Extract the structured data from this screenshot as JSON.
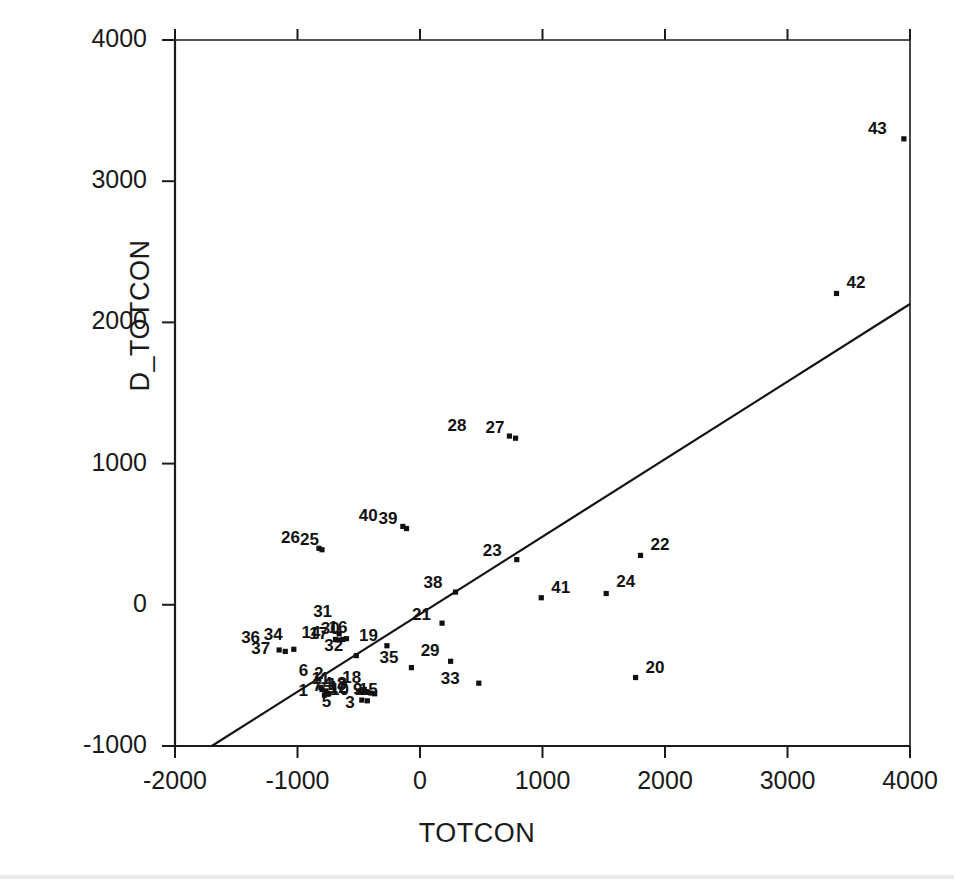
{
  "chart_data": {
    "type": "scatter",
    "title": "",
    "xlabel": "TOTCON",
    "ylabel": "D_TOTCON",
    "xlim": [
      -2000,
      4000
    ],
    "ylim": [
      -1000,
      4000
    ],
    "xticks": [
      "-2000",
      "-1000",
      "0",
      "1000",
      "2000",
      "3000",
      "4000"
    ],
    "xtick_values": [
      -2000,
      -1000,
      0,
      1000,
      2000,
      3000,
      4000
    ],
    "yticks": [
      "-1000",
      "0",
      "1000",
      "2000",
      "3000",
      "4000"
    ],
    "ytick_values": [
      -1000,
      0,
      1000,
      2000,
      3000,
      4000
    ],
    "grid": false,
    "legend": "none",
    "marker": "small-filled-square",
    "point_color": "#111111",
    "line_color": "#111111",
    "axis_color": "#1a1a1a",
    "regression_line": {
      "label": "fit-line",
      "x_start": -1700,
      "y_start": -1000,
      "x_end": 4000,
      "y_end": 2130,
      "slope": 0.549,
      "intercept": -66
    },
    "points": [
      {
        "label": "1",
        "x": -780,
        "y": -640,
        "label_dx": -26,
        "label_dy": -4
      },
      {
        "label": "2",
        "x": -800,
        "y": -600,
        "label_dx": -8,
        "label_dy": -16
      },
      {
        "label": "3",
        "x": -430,
        "y": -680,
        "label_dx": -22,
        "label_dy": 2
      },
      {
        "label": "4",
        "x": -760,
        "y": -625,
        "label_dx": -4,
        "label_dy": -9
      },
      {
        "label": "5",
        "x": -475,
        "y": -675,
        "label_dx": -40,
        "label_dy": 2
      },
      {
        "label": "6",
        "x": -810,
        "y": -585,
        "label_dx": -22,
        "label_dy": -16
      },
      {
        "label": "7",
        "x": -500,
        "y": -610,
        "label_dx": -46,
        "label_dy": -5
      },
      {
        "label": "8",
        "x": -430,
        "y": -620,
        "label_dx": -30,
        "label_dy": -8
      },
      {
        "label": "9",
        "x": -400,
        "y": -625,
        "label_dx": -18,
        "label_dy": -3
      },
      {
        "label": "10",
        "x": -440,
        "y": -615,
        "label_dx": -36,
        "label_dy": -2
      },
      {
        "label": "11",
        "x": -770,
        "y": -610,
        "label_dx": -14,
        "label_dy": -12
      },
      {
        "label": "12",
        "x": -745,
        "y": -630,
        "label_dx": 0,
        "label_dy": -6
      },
      {
        "label": "13",
        "x": -480,
        "y": -615,
        "label_dx": -34,
        "label_dy": -7
      },
      {
        "label": "14",
        "x": -690,
        "y": -245,
        "label_dx": -34,
        "label_dy": -6
      },
      {
        "label": "15",
        "x": -370,
        "y": -630,
        "label_dx": -16,
        "label_dy": -4
      },
      {
        "label": "16",
        "x": -600,
        "y": -240,
        "label_dx": -18,
        "label_dy": -11
      },
      {
        "label": "17",
        "x": -660,
        "y": -250,
        "label_dx": -30,
        "label_dy": -6
      },
      {
        "label": "18",
        "x": -455,
        "y": -600,
        "label_dx": -22,
        "label_dy": -12
      },
      {
        "label": "19",
        "x": -270,
        "y": -290,
        "label_dx": -28,
        "label_dy": -10
      },
      {
        "label": "20",
        "x": 1760,
        "y": -515,
        "label_dx": 10,
        "label_dy": -10
      },
      {
        "label": "21",
        "x": 180,
        "y": -130,
        "label_dx": -30,
        "label_dy": -8
      },
      {
        "label": "22",
        "x": 1800,
        "y": 350,
        "label_dx": 10,
        "label_dy": -10
      },
      {
        "label": "23",
        "x": 790,
        "y": 320,
        "label_dx": -34,
        "label_dy": -9
      },
      {
        "label": "24",
        "x": 1520,
        "y": 80,
        "label_dx": 10,
        "label_dy": -12
      },
      {
        "label": "25",
        "x": -800,
        "y": 390,
        "label_dx": -22,
        "label_dy": -10
      },
      {
        "label": "26",
        "x": -825,
        "y": 400,
        "label_dx": -38,
        "label_dy": -10
      },
      {
        "label": "27",
        "x": 780,
        "y": 1180,
        "label_dx": -30,
        "label_dy": -10
      },
      {
        "label": "28",
        "x": 730,
        "y": 1195,
        "label_dx": -62,
        "label_dy": -10
      },
      {
        "label": "29",
        "x": 250,
        "y": -400,
        "label_dx": -30,
        "label_dy": -10
      },
      {
        "label": "30",
        "x": -630,
        "y": -245,
        "label_dx": -22,
        "label_dy": -10
      },
      {
        "label": "31",
        "x": -660,
        "y": -205,
        "label_dx": -26,
        "label_dy": -22
      },
      {
        "label": "32",
        "x": -520,
        "y": -360,
        "label_dx": -32,
        "label_dy": -10
      },
      {
        "label": "33",
        "x": 480,
        "y": -555,
        "label_dx": -38,
        "label_dy": -4
      },
      {
        "label": "34",
        "x": -1030,
        "y": -315,
        "label_dx": -30,
        "label_dy": -14
      },
      {
        "label": "35",
        "x": -70,
        "y": -445,
        "label_dx": -32,
        "label_dy": -10
      },
      {
        "label": "36",
        "x": -1150,
        "y": -320,
        "label_dx": -38,
        "label_dy": -12
      },
      {
        "label": "37",
        "x": -1100,
        "y": -330,
        "label_dx": -34,
        "label_dy": -2
      },
      {
        "label": "38",
        "x": 290,
        "y": 90,
        "label_dx": -32,
        "label_dy": -9
      },
      {
        "label": "39",
        "x": -110,
        "y": 540,
        "label_dx": -28,
        "label_dy": -10
      },
      {
        "label": "40",
        "x": -140,
        "y": 555,
        "label_dx": -44,
        "label_dy": -10
      },
      {
        "label": "41",
        "x": 990,
        "y": 50,
        "label_dx": 10,
        "label_dy": -10
      },
      {
        "label": "42",
        "x": 3400,
        "y": 2205,
        "label_dx": 10,
        "label_dy": -10
      },
      {
        "label": "43",
        "x": 3950,
        "y": 3300,
        "label_dx": -36,
        "label_dy": -10
      }
    ]
  }
}
